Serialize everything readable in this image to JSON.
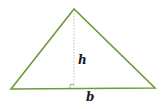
{
  "diagram": {
    "shape": "triangle",
    "colors": {
      "stroke": "#6f9a3c",
      "height_line": "#b0b0b0",
      "label": "#1a1a1a"
    },
    "labels": {
      "height": "h",
      "base": "b"
    },
    "vertices": {
      "apex": [
        74,
        9
      ],
      "left": [
        11,
        89
      ],
      "right": [
        155,
        88
      ]
    },
    "height_foot": [
      74,
      88.5
    ]
  }
}
